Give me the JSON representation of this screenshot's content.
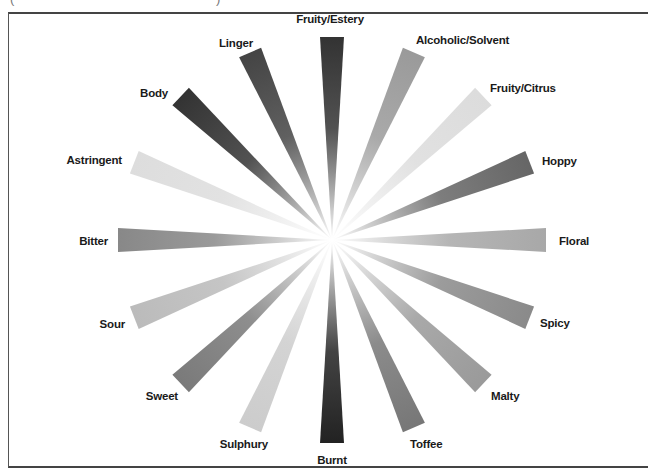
{
  "caption": {
    "open_paren": "(",
    "close_paren": ")"
  },
  "wheel": {
    "center": [
      332,
      240
    ],
    "radius_x": 214,
    "radius_y": 203,
    "bar_end_width": 24
  },
  "chart_data": {
    "type": "radial-spoke",
    "title": "",
    "spokes": [
      {
        "label": "Fruity/Estery",
        "angle": 0,
        "shade": "#333333",
        "label_pos": [
          330,
          23
        ],
        "anchor": "middle"
      },
      {
        "label": "Alcoholic/Solvent",
        "angle": 22.5,
        "shade": "#9a9a9a",
        "label_pos": [
          416,
          44
        ],
        "anchor": "start"
      },
      {
        "label": "Fruity/Citrus",
        "angle": 45,
        "shade": "#dcdcdc",
        "label_pos": [
          490,
          92
        ],
        "anchor": "start"
      },
      {
        "label": "Hoppy",
        "angle": 67.5,
        "shade": "#666666",
        "label_pos": [
          542,
          165
        ],
        "anchor": "start"
      },
      {
        "label": "Floral",
        "angle": 90,
        "shade": "#a8a8a8",
        "label_pos": [
          559,
          245
        ],
        "anchor": "start"
      },
      {
        "label": "Spicy",
        "angle": 112.5,
        "shade": "#8a8a8a",
        "label_pos": [
          540,
          327
        ],
        "anchor": "start"
      },
      {
        "label": "Malty",
        "angle": 135,
        "shade": "#9a9a9a",
        "label_pos": [
          491,
          400
        ],
        "anchor": "start"
      },
      {
        "label": "Toffee",
        "angle": 157.5,
        "shade": "#777777",
        "label_pos": [
          410,
          448
        ],
        "anchor": "start"
      },
      {
        "label": "Burnt",
        "angle": 180,
        "shade": "#222222",
        "label_pos": [
          332,
          464
        ],
        "anchor": "middle"
      },
      {
        "label": "Sulphury",
        "angle": 202.5,
        "shade": "#cccccc",
        "label_pos": [
          268,
          448
        ],
        "anchor": "end"
      },
      {
        "label": "Sweet",
        "angle": 225,
        "shade": "#7a7a7a",
        "label_pos": [
          178,
          400
        ],
        "anchor": "end"
      },
      {
        "label": "Sour",
        "angle": 247.5,
        "shade": "#bbbbbb",
        "label_pos": [
          125,
          328
        ],
        "anchor": "end"
      },
      {
        "label": "Bitter",
        "angle": 270,
        "shade": "#888888",
        "label_pos": [
          108,
          245
        ],
        "anchor": "end"
      },
      {
        "label": "Astringent",
        "angle": 292.5,
        "shade": "#dddddd",
        "label_pos": [
          122,
          164
        ],
        "anchor": "end"
      },
      {
        "label": "Body",
        "angle": 315,
        "shade": "#333333",
        "label_pos": [
          168,
          97
        ],
        "anchor": "end"
      },
      {
        "label": "Linger",
        "angle": 337.5,
        "shade": "#444444",
        "label_pos": [
          253,
          47
        ],
        "anchor": "end"
      }
    ]
  }
}
